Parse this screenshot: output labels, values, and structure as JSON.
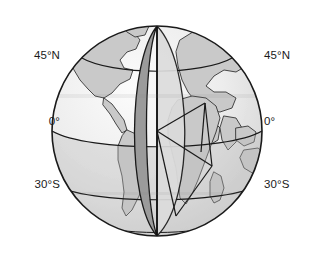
{
  "figure": {
    "background_color": "#ffffff"
  },
  "labels": {
    "left": [
      {
        "text": "45°N",
        "x": 18,
        "y": 56,
        "name": "lat-label-45n-left"
      },
      {
        "text": "0°",
        "x": 18,
        "y": 122,
        "name": "lat-label-0-left"
      },
      {
        "text": "30°S",
        "x": 18,
        "y": 185,
        "name": "lat-label-30s-left"
      }
    ],
    "right": [
      {
        "text": "45°N",
        "x": 262,
        "y": 56,
        "name": "lat-label-45n-right"
      },
      {
        "text": "0°",
        "x": 262,
        "y": 122,
        "name": "lat-label-0-right"
      },
      {
        "text": "30°S",
        "x": 262,
        "y": 185,
        "name": "lat-label-30s-right"
      }
    ]
  },
  "globe": {
    "center_x": 157,
    "center_y": 131,
    "radius": 105,
    "outline_color": "#1a1a1a",
    "ocean_color": "#f2f2f2",
    "land_color": "#c9c9c9",
    "lune_dark_color": "#9a9a9a",
    "lune_light_color": "#d8d8d8",
    "band_color": "#cfcfcf",
    "line_color": "#1a1a1a"
  },
  "latitudes": [
    {
      "name": "45N",
      "label": "45°N",
      "value": 45
    },
    {
      "name": "equator",
      "label": "0°",
      "value": 0
    },
    {
      "name": "30S",
      "label": "30°S",
      "value": -30
    }
  ],
  "features": [
    {
      "name": "north-america-outline"
    },
    {
      "name": "south-america-outline"
    },
    {
      "name": "africa-outline"
    },
    {
      "name": "eurasia-outline"
    },
    {
      "name": "madagascar-outline"
    },
    {
      "name": "australia-outline"
    },
    {
      "name": "arabian-peninsula-outline"
    }
  ],
  "overlays": [
    {
      "name": "central-meridian"
    },
    {
      "name": "dark-lune-wedge"
    },
    {
      "name": "light-lune-wedge"
    },
    {
      "name": "spherical-triangle"
    }
  ]
}
